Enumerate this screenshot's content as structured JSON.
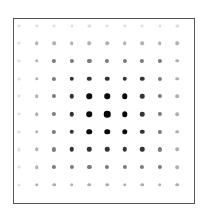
{
  "diagram": {
    "type": "dot-grid",
    "rows": 10,
    "cols": 10,
    "center": {
      "row": 5,
      "col": 5
    },
    "grid_origin_px": {
      "x": 19,
      "y": 25.5
    },
    "spacing_px": {
      "x": 17.6,
      "y": 17.7
    },
    "frame": {
      "left": 13,
      "top": 18,
      "width": 180,
      "height": 184,
      "border_color": "#555555"
    },
    "ring_metric": "chebyshev-distance-from-center",
    "rings": [
      {
        "ring": 0,
        "color": "#000000",
        "size": 6.5
      },
      {
        "ring": 1,
        "color": "#0a0a0a",
        "size": 5.5
      },
      {
        "ring": 2,
        "color": "#333333",
        "size": 4.5
      },
      {
        "ring": 3,
        "color": "#7a7a7a",
        "size": 4.2
      },
      {
        "ring": 4,
        "color": "#b0b0b0",
        "size": 3.6
      },
      {
        "ring": 5,
        "color": "#dddddd",
        "size": 3.2
      }
    ],
    "intensity_matrix": [
      [
        5,
        5,
        5,
        5,
        5,
        5,
        5,
        5,
        5,
        5
      ],
      [
        5,
        4,
        4,
        4,
        4,
        4,
        4,
        4,
        4,
        4
      ],
      [
        5,
        4,
        3,
        3,
        3,
        3,
        3,
        3,
        3,
        4
      ],
      [
        5,
        4,
        3,
        2,
        2,
        2,
        2,
        2,
        3,
        4
      ],
      [
        5,
        4,
        3,
        2,
        1,
        1,
        1,
        2,
        3,
        4
      ],
      [
        5,
        4,
        3,
        2,
        1,
        0,
        1,
        2,
        3,
        4
      ],
      [
        5,
        4,
        3,
        2,
        1,
        1,
        1,
        2,
        3,
        4
      ],
      [
        5,
        4,
        3,
        2,
        2,
        2,
        2,
        2,
        3,
        4
      ],
      [
        5,
        4,
        3,
        3,
        3,
        3,
        3,
        3,
        3,
        4
      ],
      [
        5,
        4,
        4,
        4,
        4,
        4,
        4,
        4,
        4,
        4
      ]
    ]
  }
}
